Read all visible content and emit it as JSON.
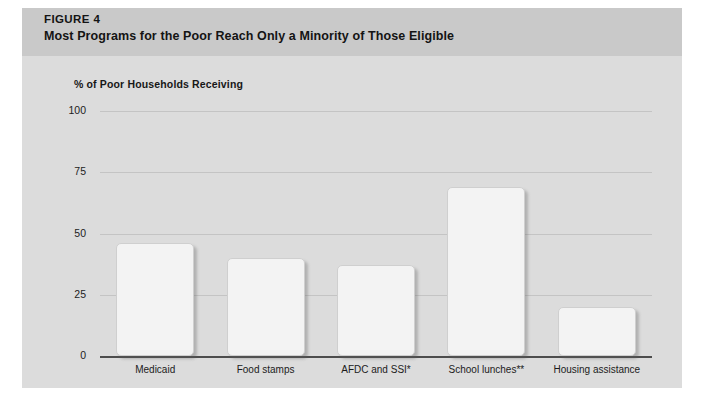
{
  "figure": {
    "number_label": "FIGURE 4",
    "title": "Most Programs for the Poor Reach Only a Minority of Those Eligible"
  },
  "colors": {
    "page_background": "#ffffff",
    "figure_background": "#dcdcdc",
    "header_band": "#c9c9c9",
    "bar_fill": "#f3f3f3",
    "bar_border": "#cfcfcf",
    "gridline": "#c4c4c4",
    "axis_line": "#4d4d4d",
    "text": "#141414"
  },
  "chart_data": {
    "type": "bar",
    "title": "Most Programs for the Poor Reach Only a Minority of Those Eligible",
    "subtitle": "% of Poor Households Receiving",
    "categories": [
      "Medicaid",
      "Food stamps",
      "AFDC and SSI*",
      "School lunches**",
      "Housing assistance"
    ],
    "values": [
      46,
      40,
      37,
      69,
      20
    ],
    "xlabel": "",
    "ylabel": "% of Poor Households Receiving",
    "ylim": [
      0,
      100
    ],
    "yticks": [
      0,
      25,
      50,
      75,
      100
    ],
    "ytick_labels": [
      "0",
      "25",
      "50",
      "75",
      "100"
    ],
    "grid": true,
    "legend": false
  }
}
